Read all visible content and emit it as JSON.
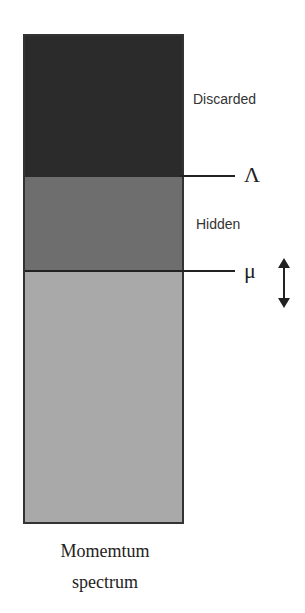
{
  "diagram": {
    "regions": [
      {
        "label": "Discarded",
        "color": "#2b2b2b"
      },
      {
        "label": "Hidden",
        "color": "#6e6e6e"
      },
      {
        "label": "",
        "color": "#a9a9a9"
      }
    ],
    "scales": [
      {
        "symbol": "Λ"
      },
      {
        "symbol": "μ",
        "movable_indicator": "↕"
      }
    ],
    "caption_line1": "Momemtum",
    "caption_line2": "spectrum"
  }
}
